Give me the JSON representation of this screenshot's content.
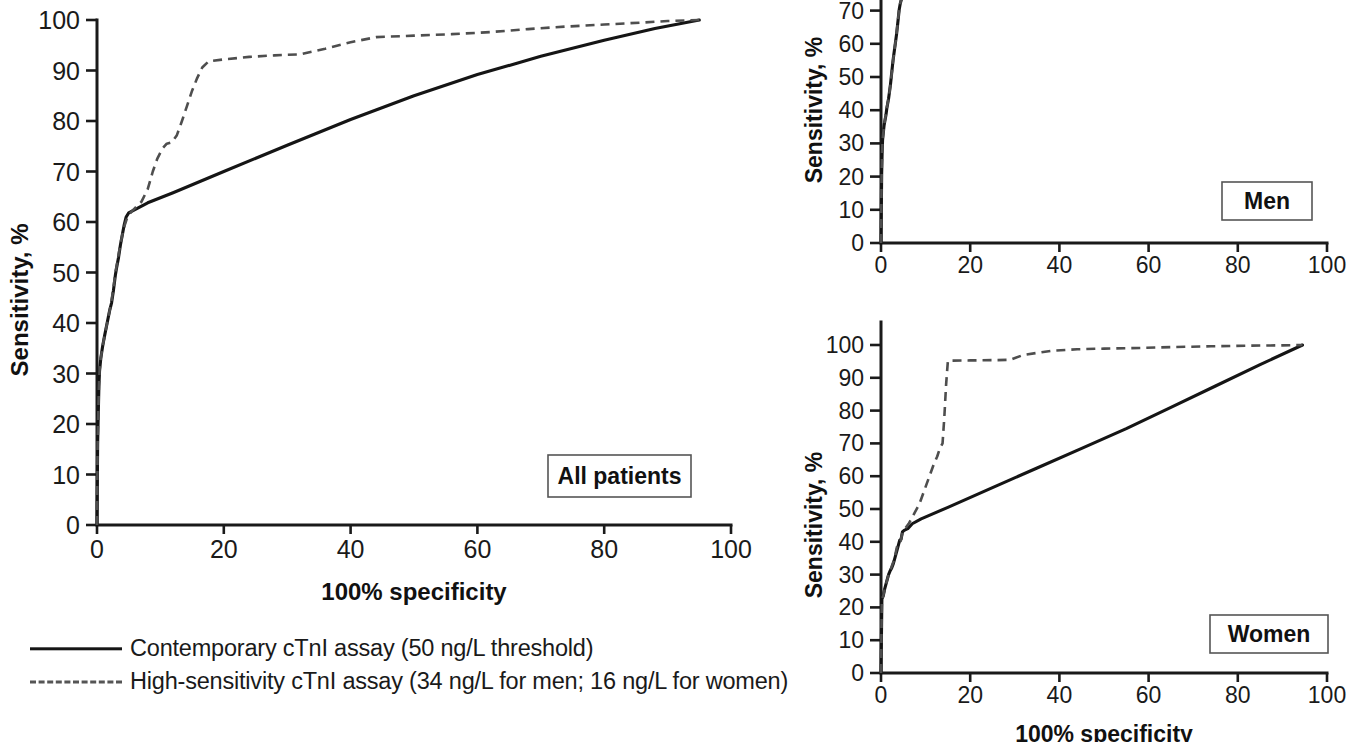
{
  "figure": {
    "kind": "roc-curve-figure",
    "panels": [
      "All patients",
      "Men",
      "Women"
    ]
  },
  "legend": {
    "items": [
      {
        "style": "solid",
        "label": "Contemporary cTnI assay (50 ng/L threshold)"
      },
      {
        "style": "dashed",
        "label": "High-sensitivity cTnI assay (34 ng/L for men; 16 ng/L for women)"
      }
    ]
  },
  "panel_all": {
    "tag": "All patients",
    "ylabel": "Sensitivity, %",
    "xlabel": "100% specificity",
    "xticks": [
      "0",
      "20",
      "40",
      "60",
      "80",
      "100"
    ],
    "yticks": [
      "0",
      "10",
      "20",
      "30",
      "40",
      "50",
      "60",
      "70",
      "80",
      "90",
      "100"
    ]
  },
  "panel_men": {
    "tag": "Men",
    "ylabel": "Sensitivity, %",
    "xticks": [
      "0",
      "20",
      "40",
      "60",
      "80",
      "100"
    ],
    "yticks": [
      "0",
      "10",
      "20",
      "30",
      "40",
      "50",
      "60",
      "70"
    ]
  },
  "panel_women": {
    "tag": "Women",
    "ylabel": "Sensitivity, %",
    "xlabel": "100% specificity",
    "xticks": [
      "0",
      "20",
      "40",
      "60",
      "80",
      "100"
    ],
    "yticks": [
      "0",
      "10",
      "20",
      "30",
      "40",
      "50",
      "60",
      "70",
      "80",
      "90",
      "100"
    ]
  },
  "chart_data": [
    {
      "id": "all_patients",
      "type": "line",
      "title": "All patients",
      "xlabel": "100% specificity",
      "ylabel": "Sensitivity, %",
      "xlim": [
        0,
        100
      ],
      "ylim": [
        0,
        100
      ],
      "grid": false,
      "legend_position": "below-left",
      "series": [
        {
          "name": "Contemporary cTnI assay (50 ng/L threshold)",
          "style": "solid",
          "points": [
            [
              0.0,
              0.0
            ],
            [
              0.1,
              16.0
            ],
            [
              0.2,
              22.0
            ],
            [
              0.3,
              27.5
            ],
            [
              0.4,
              30.5
            ],
            [
              0.6,
              33.0
            ],
            [
              0.9,
              35.5
            ],
            [
              1.2,
              37.5
            ],
            [
              1.6,
              40.0
            ],
            [
              2.0,
              42.5
            ],
            [
              2.3,
              44.0
            ],
            [
              2.6,
              46.5
            ],
            [
              2.9,
              49.5
            ],
            [
              3.1,
              51.0
            ],
            [
              3.4,
              53.0
            ],
            [
              3.7,
              55.5
            ],
            [
              4.0,
              57.5
            ],
            [
              4.3,
              59.5
            ],
            [
              4.6,
              61.0
            ],
            [
              5.0,
              61.8
            ],
            [
              5.6,
              62.2
            ],
            [
              6.5,
              62.8
            ],
            [
              8.0,
              63.8
            ],
            [
              12.0,
              65.8
            ],
            [
              20.0,
              70.0
            ],
            [
              30.0,
              75.2
            ],
            [
              40.0,
              80.3
            ],
            [
              50.0,
              85.0
            ],
            [
              60.0,
              89.2
            ],
            [
              70.0,
              92.8
            ],
            [
              80.0,
              96.0
            ],
            [
              88.0,
              98.3
            ],
            [
              95.0,
              100.0
            ]
          ]
        },
        {
          "name": "High-sensitivity cTnI assay (34 ng/L for men; 16 ng/L for women)",
          "style": "dashed",
          "points": [
            [
              0.0,
              0.0
            ],
            [
              0.1,
              16.0
            ],
            [
              0.2,
              22.0
            ],
            [
              0.3,
              27.5
            ],
            [
              0.4,
              30.5
            ],
            [
              0.6,
              33.0
            ],
            [
              0.9,
              35.5
            ],
            [
              1.2,
              37.5
            ],
            [
              1.6,
              40.0
            ],
            [
              2.0,
              42.5
            ],
            [
              2.3,
              44.5
            ],
            [
              2.6,
              47.0
            ],
            [
              2.9,
              50.0
            ],
            [
              3.2,
              52.0
            ],
            [
              3.6,
              55.0
            ],
            [
              4.0,
              57.5
            ],
            [
              4.4,
              59.5
            ],
            [
              4.8,
              61.0
            ],
            [
              5.4,
              62.0
            ],
            [
              6.2,
              63.0
            ],
            [
              7.0,
              64.0
            ],
            [
              8.0,
              66.5
            ],
            [
              8.8,
              70.0
            ],
            [
              9.5,
              72.5
            ],
            [
              10.3,
              74.5
            ],
            [
              11.0,
              75.5
            ],
            [
              11.8,
              75.8
            ],
            [
              12.6,
              77.2
            ],
            [
              13.4,
              80.0
            ],
            [
              14.2,
              83.0
            ],
            [
              15.0,
              86.0
            ],
            [
              15.8,
              88.5
            ],
            [
              16.6,
              90.6
            ],
            [
              17.6,
              91.8
            ],
            [
              20.0,
              92.2
            ],
            [
              24.0,
              92.7
            ],
            [
              28.0,
              93.0
            ],
            [
              32.0,
              93.2
            ],
            [
              36.0,
              94.3
            ],
            [
              40.0,
              95.6
            ],
            [
              44.0,
              96.6
            ],
            [
              50.0,
              96.9
            ],
            [
              56.0,
              97.2
            ],
            [
              62.0,
              97.6
            ],
            [
              68.0,
              98.2
            ],
            [
              74.0,
              98.7
            ],
            [
              80.0,
              99.1
            ],
            [
              86.0,
              99.5
            ],
            [
              90.0,
              99.8
            ],
            [
              95.0,
              100.0
            ]
          ]
        }
      ]
    },
    {
      "id": "men",
      "type": "line",
      "title": "Men",
      "xlabel": "100% specificity",
      "ylabel": "Sensitivity, %",
      "xlim": [
        0,
        100
      ],
      "ylim": [
        0,
        100
      ],
      "note": "panel is cropped at top of image; only 0-73 visible",
      "grid": false,
      "series": [
        {
          "name": "Contemporary cTnI assay (50 ng/L threshold)",
          "style": "solid",
          "points": [
            [
              0.0,
              0.0
            ],
            [
              0.15,
              21.0
            ],
            [
              0.25,
              27.0
            ],
            [
              0.35,
              31.0
            ],
            [
              0.5,
              33.0
            ],
            [
              0.7,
              35.5
            ],
            [
              0.9,
              37.0
            ],
            [
              1.1,
              38.5
            ],
            [
              1.3,
              40.5
            ],
            [
              1.5,
              42.0
            ],
            [
              1.7,
              43.5
            ],
            [
              1.9,
              45.5
            ],
            [
              2.1,
              47.5
            ],
            [
              2.3,
              50.0
            ],
            [
              2.5,
              52.5
            ],
            [
              2.7,
              55.0
            ],
            [
              2.9,
              57.0
            ],
            [
              3.1,
              59.0
            ],
            [
              3.3,
              61.0
            ],
            [
              3.5,
              63.0
            ],
            [
              3.7,
              65.5
            ],
            [
              3.9,
              68.0
            ],
            [
              4.1,
              70.5
            ],
            [
              4.3,
              72.0
            ],
            [
              4.6,
              73.5
            ],
            [
              5.0,
              75.0
            ]
          ]
        },
        {
          "name": "High-sensitivity cTnI assay (34 ng/L for men; 16 ng/L for women)",
          "style": "dashed",
          "points": [
            [
              0.0,
              0.0
            ],
            [
              0.15,
              21.0
            ],
            [
              0.25,
              27.0
            ],
            [
              0.35,
              31.0
            ],
            [
              0.5,
              33.0
            ],
            [
              0.7,
              35.5
            ],
            [
              0.9,
              37.2
            ],
            [
              1.1,
              38.8
            ],
            [
              1.3,
              40.8
            ],
            [
              1.5,
              42.2
            ],
            [
              1.8,
              44.0
            ],
            [
              2.0,
              46.5
            ],
            [
              2.2,
              48.5
            ],
            [
              2.4,
              51.0
            ],
            [
              2.6,
              53.5
            ],
            [
              2.8,
              56.0
            ],
            [
              3.0,
              58.0
            ],
            [
              3.2,
              60.0
            ],
            [
              3.4,
              62.0
            ],
            [
              3.6,
              64.5
            ],
            [
              3.8,
              67.0
            ],
            [
              4.0,
              69.5
            ],
            [
              4.2,
              71.5
            ],
            [
              4.5,
              73.2
            ],
            [
              4.9,
              75.0
            ]
          ]
        }
      ]
    },
    {
      "id": "women",
      "type": "line",
      "title": "Women",
      "xlabel": "100% specificity",
      "ylabel": "Sensitivity, %",
      "xlim": [
        0,
        100
      ],
      "ylim": [
        0,
        100
      ],
      "grid": false,
      "series": [
        {
          "name": "Contemporary cTnI assay (50 ng/L threshold)",
          "style": "solid",
          "points": [
            [
              0.0,
              0.0
            ],
            [
              0.2,
              22.5
            ],
            [
              0.5,
              23.5
            ],
            [
              0.8,
              25.5
            ],
            [
              1.1,
              27.0
            ],
            [
              1.4,
              28.5
            ],
            [
              1.7,
              30.0
            ],
            [
              2.0,
              31.0
            ],
            [
              2.4,
              32.0
            ],
            [
              2.8,
              33.5
            ],
            [
              3.2,
              35.5
            ],
            [
              3.6,
              37.5
            ],
            [
              3.9,
              39.0
            ],
            [
              4.2,
              40.5
            ],
            [
              4.5,
              40.8
            ],
            [
              4.8,
              43.0
            ],
            [
              5.2,
              43.5
            ],
            [
              6.0,
              44.0
            ],
            [
              7.0,
              45.5
            ],
            [
              9.0,
              47.0
            ],
            [
              15.0,
              50.5
            ],
            [
              25.0,
              56.5
            ],
            [
              35.0,
              62.5
            ],
            [
              45.0,
              68.5
            ],
            [
              55.0,
              74.5
            ],
            [
              65.0,
              81.0
            ],
            [
              75.0,
              87.5
            ],
            [
              85.0,
              94.0
            ],
            [
              94.5,
              100.0
            ]
          ]
        },
        {
          "name": "High-sensitivity cTnI assay (34 ng/L for men; 16 ng/L for women)",
          "style": "dashed",
          "points": [
            [
              0.0,
              0.0
            ],
            [
              0.2,
              22.5
            ],
            [
              0.5,
              23.5
            ],
            [
              0.8,
              25.5
            ],
            [
              1.1,
              27.0
            ],
            [
              1.4,
              28.5
            ],
            [
              1.7,
              30.0
            ],
            [
              2.0,
              31.0
            ],
            [
              2.4,
              32.5
            ],
            [
              2.8,
              34.0
            ],
            [
              3.2,
              36.0
            ],
            [
              3.5,
              38.0
            ],
            [
              3.8,
              39.5
            ],
            [
              4.1,
              40.0
            ],
            [
              4.4,
              40.2
            ],
            [
              4.8,
              42.8
            ],
            [
              5.4,
              44.0
            ],
            [
              6.2,
              45.5
            ],
            [
              7.0,
              47.5
            ],
            [
              7.8,
              49.5
            ],
            [
              8.6,
              51.5
            ],
            [
              9.4,
              54.5
            ],
            [
              10.2,
              57.5
            ],
            [
              11.0,
              60.5
            ],
            [
              11.8,
              63.5
            ],
            [
              12.6,
              66.0
            ],
            [
              13.2,
              68.5
            ],
            [
              13.8,
              70.0
            ],
            [
              14.2,
              78.0
            ],
            [
              14.6,
              88.0
            ],
            [
              15.0,
              95.2
            ],
            [
              20.0,
              95.3
            ],
            [
              26.0,
              95.4
            ],
            [
              29.0,
              95.5
            ],
            [
              32.0,
              97.0
            ],
            [
              38.0,
              98.2
            ],
            [
              44.0,
              98.7
            ],
            [
              50.0,
              98.9
            ],
            [
              58.0,
              99.1
            ],
            [
              66.0,
              99.4
            ],
            [
              74.0,
              99.6
            ],
            [
              82.0,
              99.8
            ],
            [
              90.0,
              99.9
            ],
            [
              94.5,
              100.0
            ]
          ]
        }
      ]
    }
  ]
}
